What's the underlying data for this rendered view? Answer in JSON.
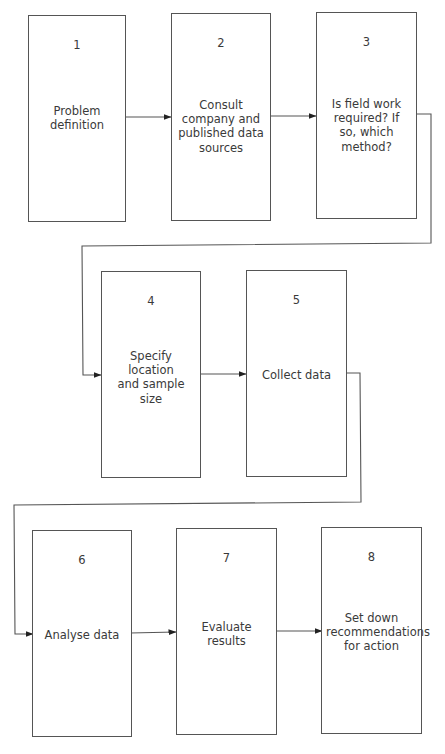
{
  "diagram": {
    "type": "flowchart",
    "steps": [
      {
        "number": "1",
        "label": "Problem definition",
        "lines": [
          "Problem",
          "definition"
        ]
      },
      {
        "number": "2",
        "label": "Consult company and published data sources",
        "lines": [
          "Consult",
          "company and",
          "published data",
          "sources"
        ]
      },
      {
        "number": "3",
        "label": "Is field work required? If so, which method?",
        "lines": [
          "Is field work",
          "required? If",
          "so, which",
          "method?"
        ]
      },
      {
        "number": "4",
        "label": "Specify location and sample size",
        "lines": [
          "Specify location",
          "and sample",
          "size"
        ]
      },
      {
        "number": "5",
        "label": "Collect data",
        "lines": [
          "Collect data"
        ]
      },
      {
        "number": "6",
        "label": "Analyse data",
        "lines": [
          "Analyse data"
        ]
      },
      {
        "number": "7",
        "label": "Evaluate results",
        "lines": [
          "Evaluate",
          "results"
        ]
      },
      {
        "number": "8",
        "label": "Set down recommendations for action",
        "lines": [
          "Set down",
          "recommendations",
          "for action"
        ]
      }
    ],
    "edges": [
      {
        "from": "1",
        "to": "2"
      },
      {
        "from": "2",
        "to": "3"
      },
      {
        "from": "3",
        "to": "4"
      },
      {
        "from": "4",
        "to": "5"
      },
      {
        "from": "5",
        "to": "6"
      },
      {
        "from": "6",
        "to": "7"
      },
      {
        "from": "7",
        "to": "8"
      }
    ],
    "colors": {
      "stroke": "#555555",
      "text": "#3a3a3a",
      "background": "#ffffff"
    }
  }
}
